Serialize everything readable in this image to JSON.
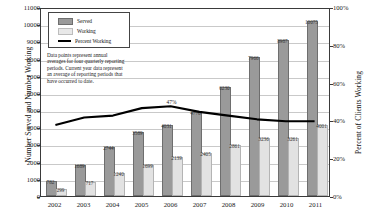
{
  "chart_data": {
    "type": "bar",
    "title": "",
    "xlabel": "",
    "ylabel": "Number Served and Number Working",
    "y2label": "Percent of Clients Working",
    "ylim": [
      0,
      11000
    ],
    "y2lim": [
      0,
      100
    ],
    "ytick_step": 1000,
    "y2tick_step": 20,
    "grid": true,
    "legend_position": "top-left",
    "categories": [
      "2002",
      "2003",
      "2004",
      "2005",
      "2006",
      "2007",
      "2008",
      "2009",
      "2010",
      "2011"
    ],
    "yticks": [
      "0",
      "1000",
      "2000",
      "3000",
      "4000",
      "5000",
      "6000",
      "7000",
      "8000",
      "9000",
      "10000",
      "11000"
    ],
    "y2ticks": [
      "0%",
      "20%",
      "40%",
      "60%",
      "80%",
      "100%"
    ],
    "series": [
      {
        "name": "Served",
        "type": "bar",
        "axis": "left",
        "color": "#9a9a9a",
        "values": [
          782,
          1689,
          2744,
          3589,
          4031,
          4776,
          6230,
          7966,
          8987,
          10075
        ],
        "labels": [
          "782",
          "1689",
          "2744",
          "3589",
          "4031",
          "4776",
          "6230",
          "7966",
          "8987",
          "10075"
        ]
      },
      {
        "name": "Working",
        "type": "bar",
        "axis": "left",
        "color": "#e2e2e2",
        "values": [
          299,
          717,
          1240,
          1699,
          2139,
          2405,
          2861,
          3236,
          3261,
          4001
        ],
        "labels": [
          "299",
          "717",
          "1240",
          "1699",
          "2139",
          "2405",
          "2861",
          "3236",
          "3261",
          "4001"
        ]
      },
      {
        "name": "Percent Working",
        "type": "line",
        "axis": "right",
        "color": "#000000",
        "values": [
          38,
          42,
          43,
          47,
          48,
          45,
          43,
          41,
          40,
          40
        ],
        "point_labels": [
          "",
          "",
          "",
          "",
          "47%",
          "",
          "",
          "",
          "",
          ""
        ]
      }
    ],
    "annotation": "Data points represent annual averages for four quarterly reporting periods. Current year data represent an average of reporting periods that have occurred to date."
  },
  "legend": {
    "items": [
      {
        "label": "Served",
        "marker": "bar-swatch-dark"
      },
      {
        "label": "Working",
        "marker": "bar-swatch-light"
      },
      {
        "label": "Percent Working",
        "marker": "line-swatch-black"
      }
    ]
  }
}
